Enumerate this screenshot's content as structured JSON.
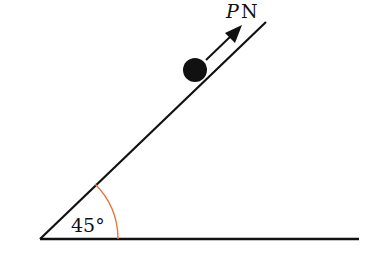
{
  "diagram": {
    "force_label_var": "P",
    "force_label_unit": "N",
    "angle_label": "45°",
    "angle_degrees": 45,
    "colors": {
      "lines": "#111111",
      "angle_arc": "#e07a3a",
      "ball": "#111111"
    }
  }
}
